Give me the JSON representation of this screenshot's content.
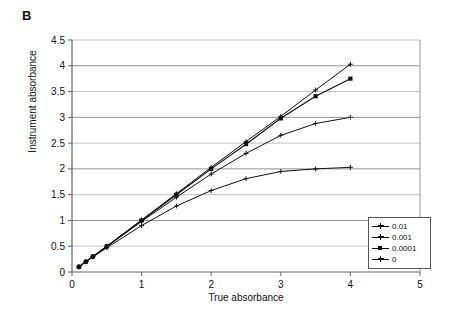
{
  "panel": {
    "label": "B"
  },
  "chart_data": {
    "type": "line",
    "title": "",
    "xlabel": "True absorbance",
    "ylabel": "Instrument absorbance",
    "xlim": [
      0,
      5
    ],
    "ylim": [
      0,
      4.5
    ],
    "xticks": [
      "0",
      "1",
      "2",
      "3",
      "4",
      "5"
    ],
    "yticks": [
      "0",
      "0.5",
      "1",
      "1.5",
      "2",
      "2.5",
      "3",
      "3.5",
      "4",
      "4.5"
    ],
    "xtick_values": [
      0,
      1,
      2,
      3,
      4,
      5
    ],
    "ytick_values": [
      0,
      0.5,
      1,
      1.5,
      2,
      2.5,
      3,
      3.5,
      4,
      4.5
    ],
    "grid": "horizontal",
    "grid_color": "#808080",
    "legend_position": "inside-lower-right",
    "series": [
      {
        "name": "0.01",
        "marker": "plus",
        "color": "#111111",
        "x": [
          0.1,
          0.2,
          0.3,
          0.5,
          1.0,
          1.5,
          2.0,
          2.5,
          3.0,
          3.5,
          4.0
        ],
        "y": [
          0.1,
          0.2,
          0.29,
          0.47,
          0.9,
          1.28,
          1.58,
          1.81,
          1.95,
          2.0,
          2.03
        ]
      },
      {
        "name": "0.001",
        "marker": "plus",
        "color": "#111111",
        "x": [
          0.1,
          0.2,
          0.3,
          0.5,
          1.0,
          1.5,
          2.0,
          2.5,
          3.0,
          3.5,
          4.0
        ],
        "y": [
          0.1,
          0.2,
          0.3,
          0.49,
          0.98,
          1.45,
          1.9,
          2.3,
          2.65,
          2.88,
          3.0
        ]
      },
      {
        "name": "0.0001",
        "marker": "square",
        "color": "#111111",
        "x": [
          0.1,
          0.2,
          0.3,
          0.5,
          1.0,
          1.5,
          2.0,
          2.5,
          3.0,
          3.5,
          4.0
        ],
        "y": [
          0.1,
          0.2,
          0.3,
          0.5,
          1.0,
          1.5,
          2.0,
          2.48,
          2.98,
          3.41,
          3.75
        ]
      },
      {
        "name": "0",
        "marker": "plus",
        "color": "#111111",
        "x": [
          0.1,
          0.2,
          0.3,
          0.5,
          1.0,
          1.5,
          2.0,
          2.5,
          3.0,
          3.5,
          4.0
        ],
        "y": [
          0.1,
          0.2,
          0.3,
          0.5,
          1.01,
          1.52,
          2.03,
          2.53,
          3.02,
          3.53,
          4.03
        ]
      }
    ]
  },
  "legend": {
    "items": [
      {
        "label": "0.01"
      },
      {
        "label": "0.001"
      },
      {
        "label": "0.0001"
      },
      {
        "label": "0"
      }
    ]
  }
}
